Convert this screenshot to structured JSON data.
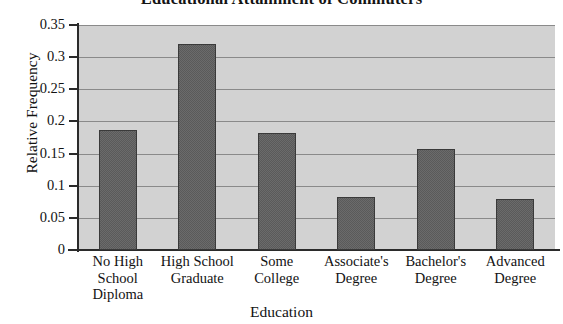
{
  "chart_data": {
    "type": "bar",
    "title": "Educational Attainment of Commuters",
    "xlabel": "Education",
    "ylabel": "Relative Frequency",
    "categories": [
      "No High School Diploma",
      "High School Graduate",
      "Some College",
      "Associate's Degree",
      "Bachelor's Degree",
      "Advanced Degree"
    ],
    "category_lines": [
      [
        "No High",
        "School",
        "Diploma"
      ],
      [
        "High School",
        "Graduate"
      ],
      [
        "Some",
        "College"
      ],
      [
        "Associate's",
        "Degree"
      ],
      [
        "Bachelor's",
        "Degree"
      ],
      [
        "Advanced",
        "Degree"
      ]
    ],
    "values": [
      0.187,
      0.32,
      0.182,
      0.083,
      0.157,
      0.079
    ],
    "ylim": [
      0,
      0.35
    ],
    "ytick_labels": [
      "0",
      "0.05",
      "0.1",
      "0.15",
      "0.2",
      "0.25",
      "0.3",
      "0.35"
    ],
    "ytick_values": [
      0,
      0.05,
      0.1,
      0.15,
      0.2,
      0.25,
      0.3,
      0.35
    ],
    "grid": true,
    "legend": "none",
    "colors": {
      "bar_fill": "#5a5a5a",
      "bar_border": "#3a3a3a",
      "plot_background": "#d2d2d2",
      "gridline": "#8a8a8a",
      "axis": "#2b2b2b",
      "text": "#121212",
      "figure_background": "#ffffff"
    }
  }
}
